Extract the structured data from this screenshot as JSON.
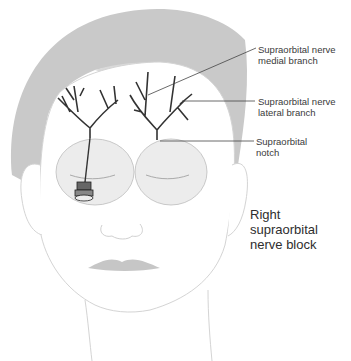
{
  "diagram": {
    "title_lines": [
      "Right",
      "supraorbital",
      "nerve block"
    ],
    "labels": [
      {
        "id": "medial",
        "lines": [
          "Supraorbital nerve",
          "medial branch"
        ]
      },
      {
        "id": "lateral",
        "lines": [
          "Supraorbital nerve",
          "lateral branch"
        ]
      },
      {
        "id": "notch",
        "lines": [
          "Supraorbital",
          "notch"
        ]
      }
    ],
    "colors": {
      "hair": "#c9c9c9",
      "skin_outline": "#d4d4d4",
      "nerve": "#333333",
      "leader_line": "#444444",
      "orbit_fill": "#ececec",
      "lips": "#c6c6c6",
      "text": "#333333"
    },
    "icons": [
      "syringe-needle-icon",
      "nerve-branch-icon"
    ]
  }
}
